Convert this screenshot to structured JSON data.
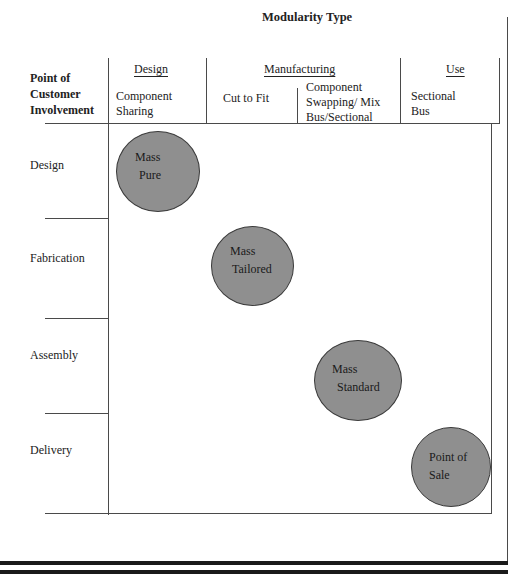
{
  "title": "Modularity Type",
  "row_header": [
    "Point of",
    "Customer",
    "Involvement"
  ],
  "column_groups": [
    {
      "label": "Design"
    },
    {
      "label": "Manufacturing"
    },
    {
      "label": "Use"
    }
  ],
  "columns": [
    {
      "label_lines": [
        "Component",
        "Sharing"
      ]
    },
    {
      "label_lines": [
        "Cut to Fit"
      ]
    },
    {
      "label_lines": [
        "Component",
        "Swapping/ Mix",
        "Bus/Sectional"
      ]
    },
    {
      "label_lines": [
        "Sectional",
        "Bus"
      ]
    }
  ],
  "rows": [
    {
      "label": "Design"
    },
    {
      "label": "Fabrication"
    },
    {
      "label": "Assembly"
    },
    {
      "label": "Delivery"
    }
  ],
  "circles": [
    {
      "lines": [
        "Mass",
        "Pure"
      ],
      "row": "Design",
      "column": "Component Sharing"
    },
    {
      "lines": [
        "Mass",
        "Tailored"
      ],
      "row": "Fabrication",
      "column": "Cut to Fit"
    },
    {
      "lines": [
        "Mass",
        "Standard"
      ],
      "row": "Assembly",
      "column": "Component Swapping/ Mix Bus/Sectional"
    },
    {
      "lines": [
        "Point of",
        "Sale"
      ],
      "row": "Delivery",
      "column": "Sectional Bus"
    }
  ],
  "colors": {
    "circle_fill": "#8f8f8f",
    "circle_stroke": "#3a3a3a",
    "line": "#4a4a4a"
  }
}
